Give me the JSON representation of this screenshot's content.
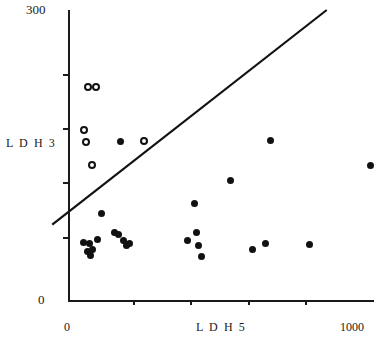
{
  "figure": {
    "title": "",
    "background": "#ffffff",
    "ink_color": "#111111"
  },
  "axes": {
    "y_label": "L D H 3",
    "y_max_label": "300",
    "y_min_label": "0",
    "x_label": "L D H 5",
    "x_min_label": "0",
    "x_max_label": "1000"
  },
  "chart_data": {
    "type": "scatter",
    "title": "",
    "xlabel": "LDH 5",
    "ylabel": "LDH 3",
    "xlim": [
      0,
      1000
    ],
    "ylim": [
      0,
      300
    ],
    "xticks": [
      0,
      200,
      400,
      600,
      800,
      1000
    ],
    "yticks": [
      0,
      60,
      120,
      180,
      240,
      300
    ],
    "grid": false,
    "legend": null,
    "series": [
      {
        "name": "open-circles",
        "marker": "open circle",
        "color": "#111111",
        "points": [
          [
            62,
            220
          ],
          [
            88,
            220
          ],
          [
            48,
            176
          ],
          [
            56,
            163
          ],
          [
            75,
            140
          ],
          [
            245,
            165
          ]
        ]
      },
      {
        "name": "filled-circles",
        "marker": "filled circle",
        "color": "#111111",
        "points": [
          [
            168,
            164
          ],
          [
            660,
            165
          ],
          [
            990,
            139
          ],
          [
            530,
            124
          ],
          [
            108,
            89
          ],
          [
            410,
            100
          ],
          [
            48,
            60
          ],
          [
            62,
            50
          ],
          [
            68,
            58
          ],
          [
            72,
            46
          ],
          [
            78,
            52
          ],
          [
            95,
            63
          ],
          [
            150,
            70
          ],
          [
            163,
            68
          ],
          [
            178,
            62
          ],
          [
            188,
            56
          ],
          [
            198,
            58
          ],
          [
            390,
            62
          ],
          [
            418,
            70
          ],
          [
            425,
            56
          ],
          [
            435,
            45
          ],
          [
            600,
            52
          ],
          [
            645,
            58
          ],
          [
            790,
            57
          ]
        ]
      }
    ],
    "annotations": [
      {
        "type": "line",
        "name": "diagonal-reference-line",
        "from": [
          -55,
          78
        ],
        "to": [
          845,
          300
        ]
      }
    ]
  },
  "ticks": {
    "y_pixel_positions": [
      74,
      128,
      182,
      237,
      292
    ],
    "x_pixel_positions": [
      133,
      190,
      248,
      305
    ]
  }
}
